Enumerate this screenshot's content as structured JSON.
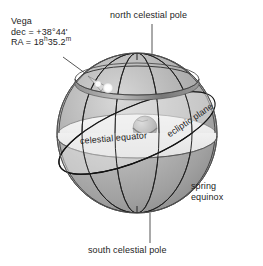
{
  "figure": {
    "type": "celestial-sphere-diagram",
    "background_color": "#ffffff",
    "sphere_color": "#a9a9a9",
    "plane_color": "#f2f2f2",
    "line_color": "#1e1e1e",
    "text_color": "#242424"
  },
  "labels": {
    "north_celestial_pole": "north celestial pole",
    "south_celestial_pole": "south celestial pole",
    "celestial_equator": "celestial equator",
    "ecliptic_plane": "ecliptic plane",
    "spring_line1": "spring",
    "spring_line2": "equinox"
  },
  "star": {
    "name": "Vega",
    "dec_line": "dec = +38°44'",
    "ra_prefix": "RA = 18",
    "ra_sup_h": "h",
    "ra_mid": "35.2",
    "ra_sup_m": "m",
    "declination_deg": 38.733,
    "right_ascension_hours": 18.5867
  },
  "elements": {
    "earth": "earth-globe",
    "star_marker": "vega-star-marker",
    "declination_circle": "vega-declination-circle",
    "polar_axis": "polar-axis",
    "meridians": 3
  }
}
